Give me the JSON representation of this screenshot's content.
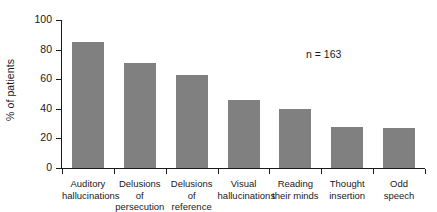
{
  "chart_data": {
    "type": "bar",
    "title": "",
    "subtitle": "",
    "xlabel": "",
    "ylabel": "% of patients",
    "ylim": [
      0,
      100
    ],
    "yticks": [
      0,
      20,
      40,
      60,
      80,
      100
    ],
    "ytick_labels": [
      "0",
      "20",
      "40",
      "60",
      "80",
      "100"
    ],
    "grid": false,
    "legend": null,
    "bar_color": "#808080",
    "axis_color": "#1a1a1a",
    "background_color": "#ffffff",
    "annotations": [
      {
        "name": "sample-size",
        "text": "n = 163",
        "x_frac": 0.67,
        "y_value": 78
      }
    ],
    "categories": [
      "Auditory hallucinations",
      "Delusions of persecution",
      "Delusions of reference",
      "Visual hallucinations",
      "Reading their minds",
      "Thought insertion",
      "Odd speech"
    ],
    "category_lines": [
      [
        "Auditory",
        "hallucinations"
      ],
      [
        "Delusions of",
        "persecution"
      ],
      [
        "Delusions of",
        "reference"
      ],
      [
        "Visual",
        "hallucinations"
      ],
      [
        "Reading",
        "their minds"
      ],
      [
        "Thought",
        "insertion"
      ],
      [
        "Odd",
        "speech"
      ]
    ],
    "values": [
      85,
      71,
      63,
      46,
      40,
      28,
      27
    ]
  }
}
